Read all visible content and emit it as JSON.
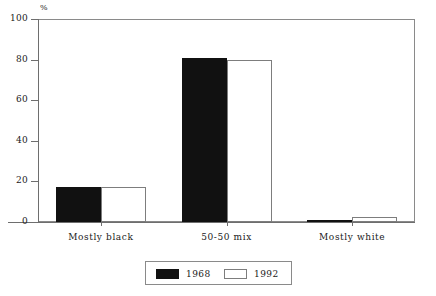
{
  "chart_data": {
    "type": "bar",
    "title": "",
    "xlabel": "",
    "ylabel": "%",
    "ylim": [
      0,
      100
    ],
    "yticks": [
      0,
      20,
      40,
      60,
      80,
      100
    ],
    "ytick_labels": [
      "0",
      "20",
      "40",
      "60",
      "80",
      "100"
    ],
    "grid": false,
    "legend_position": "bottom-center",
    "categories": [
      "Mostly black",
      "50-50 mix",
      "Mostly white"
    ],
    "series": [
      {
        "name": "1968",
        "color": "#111111",
        "values": [
          17,
          81,
          1
        ]
      },
      {
        "name": "1992",
        "color": "#ffffff",
        "values": [
          17,
          80,
          2.5
        ]
      }
    ]
  },
  "axis": {
    "unit_label": "%"
  },
  "legend": {
    "entries": [
      {
        "label": "1968",
        "swatch": "filled-black-swatch"
      },
      {
        "label": "1992",
        "swatch": "outlined-white-swatch"
      }
    ]
  }
}
